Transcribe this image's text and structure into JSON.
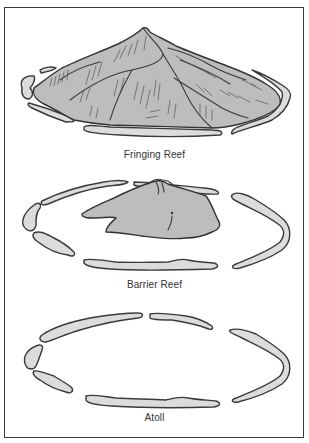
{
  "figure": {
    "panels": [
      {
        "id": "fringing",
        "label": "Fringing Reef"
      },
      {
        "id": "barrier",
        "label": "Barrier Reef"
      },
      {
        "id": "atoll",
        "label": "Atoll"
      }
    ]
  },
  "colors": {
    "reef_fill": "#dcdcdc",
    "island_fill": "#bdbdbd",
    "outline": "#3a3a3a",
    "background": "#ffffff"
  }
}
